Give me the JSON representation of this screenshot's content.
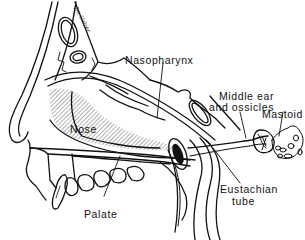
{
  "diagram": {
    "type": "anatomical-line-drawing",
    "signature": "Jm Gulzer",
    "colors": {
      "ink": "#111111",
      "background": "#ffffff"
    },
    "labels": [
      {
        "id": "nasopharynx",
        "text": "Nasopharynx"
      },
      {
        "id": "middle_ear_line1",
        "text": "Middle ear"
      },
      {
        "id": "middle_ear_line2",
        "text": "and ossicles"
      },
      {
        "id": "mastoid",
        "text": "Mastoid"
      },
      {
        "id": "nose",
        "text": "Nose"
      },
      {
        "id": "palate",
        "text": "Palate"
      },
      {
        "id": "eustachian_line1",
        "text": "Eustachian"
      },
      {
        "id": "eustachian_line2",
        "text": "tube"
      }
    ]
  }
}
